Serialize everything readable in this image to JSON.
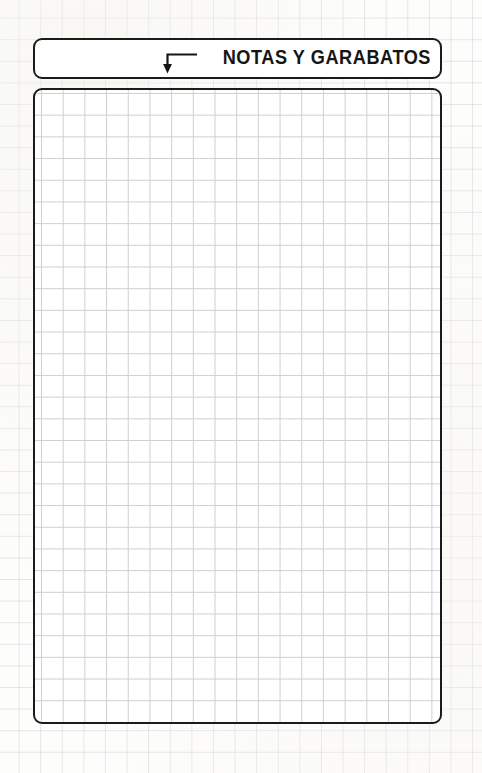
{
  "page": {
    "background_color": "#fdfdfc",
    "paper_type": "graph-paper",
    "grid_color": "#b0b0b8",
    "grid_spacing_px": 21.6
  },
  "header": {
    "title": "NOTAS Y GARABATOS",
    "arrow_icon": "elbow-arrow-down",
    "border_color": "#1b1b1b",
    "fill_color": "#ffffff"
  },
  "notes": {
    "placeholder": "",
    "value": "",
    "grid_color": "#cfcfd4",
    "grid_spacing_px": 21.7,
    "border_color": "#1b1b1b",
    "fill_color": "#ffffff"
  }
}
